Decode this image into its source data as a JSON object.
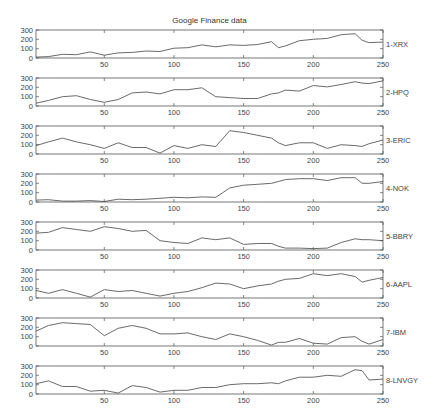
{
  "chart_data": {
    "type": "line",
    "title": "Google Finance data",
    "xlabel": "",
    "ylabel": "",
    "xlim": [
      1,
      250
    ],
    "ylim": [
      0,
      300
    ],
    "xticks": [
      50,
      100,
      150,
      200,
      250
    ],
    "yticks": [
      0,
      100,
      200,
      300
    ],
    "grid": false,
    "legend_position": "right of each panel",
    "x": [
      1,
      10,
      20,
      30,
      40,
      50,
      60,
      70,
      80,
      90,
      100,
      110,
      120,
      130,
      140,
      150,
      160,
      170,
      175,
      180,
      190,
      200,
      210,
      220,
      230,
      235,
      240,
      250
    ],
    "series": [
      {
        "name": "1-XRX",
        "values": [
          10,
          15,
          40,
          35,
          65,
          30,
          55,
          60,
          75,
          70,
          105,
          110,
          140,
          120,
          140,
          135,
          145,
          175,
          110,
          130,
          185,
          200,
          210,
          250,
          260,
          190,
          165,
          170
        ]
      },
      {
        "name": "2-HPQ",
        "values": [
          30,
          60,
          100,
          110,
          70,
          40,
          70,
          140,
          150,
          130,
          175,
          175,
          195,
          100,
          90,
          80,
          80,
          130,
          140,
          170,
          160,
          220,
          205,
          230,
          260,
          245,
          240,
          270
        ]
      },
      {
        "name": "3-ERIC",
        "values": [
          90,
          130,
          170,
          130,
          100,
          60,
          120,
          70,
          70,
          10,
          90,
          60,
          100,
          80,
          250,
          230,
          200,
          170,
          120,
          90,
          120,
          120,
          60,
          100,
          90,
          80,
          110,
          150
        ]
      },
      {
        "name": "4-NOK",
        "values": [
          20,
          25,
          10,
          10,
          15,
          5,
          30,
          25,
          30,
          40,
          50,
          45,
          55,
          50,
          150,
          180,
          190,
          200,
          220,
          240,
          250,
          250,
          230,
          260,
          260,
          200,
          200,
          220
        ]
      },
      {
        "name": "5-BBRY",
        "values": [
          180,
          190,
          240,
          220,
          200,
          250,
          230,
          200,
          210,
          100,
          80,
          70,
          130,
          110,
          130,
          60,
          70,
          70,
          40,
          20,
          20,
          15,
          20,
          80,
          120,
          110,
          110,
          100
        ]
      },
      {
        "name": "6-AAPL",
        "values": [
          80,
          50,
          90,
          50,
          10,
          90,
          70,
          80,
          50,
          20,
          50,
          70,
          110,
          160,
          150,
          100,
          130,
          150,
          180,
          200,
          210,
          260,
          240,
          260,
          230,
          170,
          190,
          220
        ]
      },
      {
        "name": "7-IBM",
        "values": [
          160,
          220,
          250,
          240,
          230,
          110,
          190,
          220,
          190,
          130,
          130,
          140,
          100,
          70,
          130,
          100,
          60,
          10,
          40,
          40,
          80,
          30,
          20,
          90,
          100,
          50,
          20,
          70
        ]
      },
      {
        "name": "8-LNVGY",
        "values": [
          110,
          140,
          80,
          80,
          30,
          40,
          10,
          90,
          70,
          20,
          40,
          40,
          70,
          70,
          100,
          110,
          110,
          120,
          110,
          140,
          180,
          180,
          200,
          190,
          260,
          250,
          150,
          160
        ]
      }
    ]
  },
  "header": {
    "title": "Google Finance data"
  }
}
